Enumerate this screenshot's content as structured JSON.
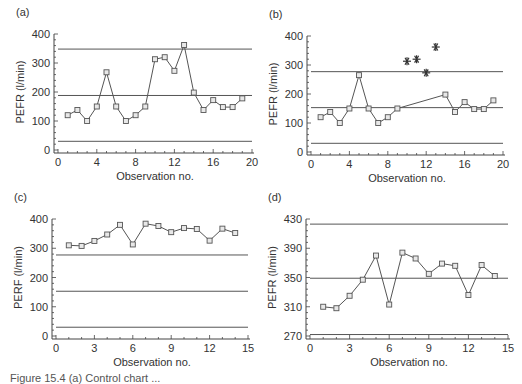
{
  "figure": {
    "caption": "Figure 15.4  (a) Control chart ..."
  },
  "chart_data": [
    {
      "id": "a",
      "panel_label": "(a)",
      "type": "line",
      "title": "",
      "xlabel": "Observation no.",
      "ylabel": "PEFR (l/min)",
      "xlim": [
        0,
        20
      ],
      "ylim": [
        0,
        400
      ],
      "xticks": [
        0,
        4,
        8,
        12,
        16,
        20
      ],
      "yticks": [
        0,
        100,
        200,
        300,
        400
      ],
      "grid": false,
      "marker": "square",
      "x": [
        1,
        2,
        3,
        4,
        5,
        6,
        7,
        8,
        9,
        10,
        11,
        12,
        13,
        14,
        15,
        16,
        17,
        18,
        19
      ],
      "series": [
        {
          "name": "PEFR",
          "values": [
            120,
            138,
            100,
            150,
            268,
            150,
            100,
            120,
            150,
            313,
            320,
            273,
            362,
            198,
            138,
            172,
            148,
            148,
            178
          ]
        }
      ],
      "excluded_points": [],
      "control_lines": {
        "upper": 348,
        "center": 188,
        "lower": 30
      },
      "box": {
        "left": 58,
        "right": 252,
        "top": 34,
        "bottom": 150
      }
    },
    {
      "id": "b",
      "panel_label": "(b)",
      "type": "line",
      "title": "",
      "xlabel": "Observation no.",
      "ylabel": "PEFR (l/min)",
      "xlim": [
        0,
        20
      ],
      "ylim": [
        0,
        400
      ],
      "xticks": [
        0,
        4,
        8,
        12,
        16,
        20
      ],
      "yticks": [
        0,
        100,
        200,
        300,
        400
      ],
      "grid": false,
      "marker": "square",
      "x": [
        1,
        2,
        3,
        4,
        5,
        6,
        7,
        8,
        9,
        14,
        15,
        16,
        17,
        18,
        19
      ],
      "series": [
        {
          "name": "PEFR",
          "values": [
            120,
            138,
            100,
            150,
            265,
            150,
            100,
            120,
            150,
            198,
            138,
            172,
            148,
            148,
            178
          ]
        }
      ],
      "excluded_points": [
        {
          "x": 10,
          "y": 313
        },
        {
          "x": 11,
          "y": 320
        },
        {
          "x": 12,
          "y": 273
        },
        {
          "x": 13,
          "y": 362
        }
      ],
      "control_lines": {
        "upper": 277,
        "center": 153,
        "lower": 30
      },
      "box": {
        "left": 311,
        "right": 503,
        "top": 36,
        "bottom": 152
      }
    },
    {
      "id": "c",
      "panel_label": "(c)",
      "type": "line",
      "title": "",
      "xlabel": "Observation no.",
      "ylabel": "PERF (l/min)",
      "xlim": [
        0,
        15
      ],
      "ylim": [
        0,
        400
      ],
      "xticks": [
        0,
        3,
        6,
        9,
        12,
        15
      ],
      "yticks": [
        0,
        100,
        200,
        300,
        400
      ],
      "grid": false,
      "marker": "square",
      "x": [
        1,
        2,
        3,
        4,
        5,
        6,
        7,
        8,
        9,
        10,
        11,
        12,
        13,
        14
      ],
      "series": [
        {
          "name": "PEFR",
          "values": [
            310,
            308,
            325,
            347,
            380,
            313,
            384,
            376,
            355,
            369,
            366,
            326,
            367,
            352
          ]
        }
      ],
      "excluded_points": [],
      "control_lines": {
        "upper": 277,
        "center": 153,
        "lower": 30
      },
      "box": {
        "left": 56,
        "right": 248,
        "top": 219,
        "bottom": 336
      }
    },
    {
      "id": "d",
      "panel_label": "(d)",
      "type": "line",
      "title": "",
      "xlabel": "Observation no.",
      "ylabel": "PEFR (l/min)",
      "xlim": [
        0,
        15
      ],
      "ylim": [
        270,
        430
      ],
      "xticks": [
        0,
        3,
        6,
        9,
        12,
        15
      ],
      "yticks": [
        270,
        310,
        350,
        390,
        430
      ],
      "grid": false,
      "marker": "square",
      "x": [
        1,
        2,
        3,
        4,
        5,
        6,
        7,
        8,
        9,
        10,
        11,
        12,
        13,
        14
      ],
      "series": [
        {
          "name": "PEFR",
          "values": [
            310,
            308,
            325,
            347,
            380,
            313,
            384,
            376,
            355,
            369,
            366,
            326,
            367,
            352
          ]
        }
      ],
      "excluded_points": [],
      "control_lines": {
        "upper": 423,
        "center": 349,
        "lower": 272
      },
      "box": {
        "left": 310,
        "right": 508,
        "top": 219,
        "bottom": 336
      }
    }
  ],
  "style": {
    "line_color": "#555555",
    "marker_fill": "#e8e8e8",
    "axis_color": "#444444",
    "control_line_color": "#555555",
    "text_color": "#333333"
  }
}
